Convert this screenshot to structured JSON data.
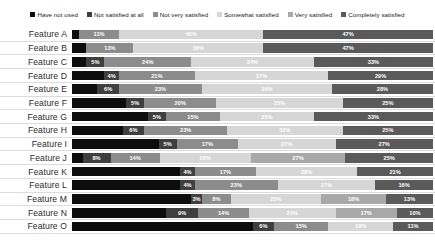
{
  "chart_data": {
    "type": "bar",
    "subtype": "stacked-horizontal-100pct",
    "title": "",
    "xlabel": "",
    "ylabel": "",
    "xlim": [
      0,
      100
    ],
    "grid": false,
    "legend_position": "top-center",
    "categories": [
      "Feature A",
      "Feature B",
      "Feature C",
      "Feature D",
      "Feature E",
      "Feature F",
      "Feature G",
      "Feature H",
      "Feature I",
      "Feature J",
      "Feature K",
      "Feature L",
      "Feature M",
      "Feature N",
      "Feature O"
    ],
    "series": [
      {
        "name": "Have not used",
        "color": "#0d0d0d",
        "values": [
          2,
          4,
          9,
          9,
          13,
          15,
          21,
          14,
          24,
          3,
          30,
          30,
          33,
          26,
          50
        ]
      },
      {
        "name": "Not satisfied at all",
        "color": "#3f3f3f",
        "values": [
          0,
          0,
          5,
          4,
          6,
          5,
          5,
          6,
          5,
          8,
          4,
          4,
          3,
          9,
          6
        ]
      },
      {
        "name": "Not very satisfied",
        "color": "#8c8c8c",
        "values": [
          11,
          13,
          24,
          21,
          23,
          20,
          15,
          23,
          17,
          14,
          17,
          23,
          8,
          14,
          15
        ]
      },
      {
        "name": "Somewhat satisfied",
        "color": "#d6d6d6",
        "values": [
          40,
          36,
          34,
          37,
          36,
          35,
          26,
          32,
          27,
          26,
          28,
          27,
          25,
          24,
          18
        ]
      },
      {
        "name": "Very satisfied",
        "color": "#a8a8a8",
        "values": [
          0,
          0,
          0,
          0,
          0,
          0,
          0,
          0,
          0,
          27,
          0,
          0,
          18,
          17,
          0
        ]
      },
      {
        "name": "Completely satisfied",
        "color": "#5a5a5a",
        "values": [
          47,
          47,
          33,
          29,
          28,
          25,
          33,
          25,
          27,
          25,
          21,
          16,
          13,
          10,
          11
        ]
      }
    ],
    "rows": [
      {
        "label": "Feature A",
        "segments": [
          {
            "series": "Have not used",
            "value": 2,
            "label": "",
            "color": "#0d0d0d",
            "text": "on-dark"
          },
          {
            "series": "Not very satisfied",
            "value": 11,
            "label": "11%",
            "color": "#8c8c8c",
            "text": "on-light"
          },
          {
            "series": "Somewhat satisfied",
            "value": 40,
            "label": "40%",
            "color": "#d6d6d6",
            "text": "on-pale"
          },
          {
            "series": "Completely satisfied",
            "value": 47,
            "label": "47%",
            "color": "#5a5a5a",
            "text": "on-dark"
          }
        ]
      },
      {
        "label": "Feature B",
        "segments": [
          {
            "series": "Have not used",
            "value": 4,
            "label": "",
            "color": "#0d0d0d",
            "text": "on-dark"
          },
          {
            "series": "Not very satisfied",
            "value": 13,
            "label": "13%",
            "color": "#8c8c8c",
            "text": "on-light"
          },
          {
            "series": "Somewhat satisfied",
            "value": 36,
            "label": "36%",
            "color": "#d6d6d6",
            "text": "on-pale"
          },
          {
            "series": "Completely satisfied",
            "value": 47,
            "label": "47%",
            "color": "#5a5a5a",
            "text": "on-dark"
          }
        ]
      },
      {
        "label": "Feature C",
        "segments": [
          {
            "series": "Have not used",
            "value": 4,
            "label": "",
            "color": "#0d0d0d",
            "text": "on-dark"
          },
          {
            "series": "Not satisfied at all",
            "value": 5,
            "label": "5%",
            "color": "#3f3f3f",
            "text": "on-dark"
          },
          {
            "series": "Not very satisfied",
            "value": 24,
            "label": "24%",
            "color": "#8c8c8c",
            "text": "on-light"
          },
          {
            "series": "Somewhat satisfied",
            "value": 34,
            "label": "34%",
            "color": "#d6d6d6",
            "text": "on-pale"
          },
          {
            "series": "Completely satisfied",
            "value": 33,
            "label": "33%",
            "color": "#5a5a5a",
            "text": "on-dark"
          }
        ]
      },
      {
        "label": "Feature D",
        "segments": [
          {
            "series": "Have not used",
            "value": 9,
            "label": "",
            "color": "#0d0d0d",
            "text": "on-dark"
          },
          {
            "series": "Not satisfied at all",
            "value": 4,
            "label": "4%",
            "color": "#3f3f3f",
            "text": "on-dark"
          },
          {
            "series": "Not very satisfied",
            "value": 21,
            "label": "21%",
            "color": "#8c8c8c",
            "text": "on-light"
          },
          {
            "series": "Somewhat satisfied",
            "value": 37,
            "label": "37%",
            "color": "#d6d6d6",
            "text": "on-pale"
          },
          {
            "series": "Completely satisfied",
            "value": 29,
            "label": "29%",
            "color": "#5a5a5a",
            "text": "on-dark"
          }
        ]
      },
      {
        "label": "Feature E",
        "segments": [
          {
            "series": "Have not used",
            "value": 7,
            "label": "",
            "color": "#0d0d0d",
            "text": "on-dark"
          },
          {
            "series": "Not satisfied at all",
            "value": 6,
            "label": "6%",
            "color": "#3f3f3f",
            "text": "on-dark"
          },
          {
            "series": "Not very satisfied",
            "value": 23,
            "label": "23%",
            "color": "#8c8c8c",
            "text": "on-light"
          },
          {
            "series": "Somewhat satisfied",
            "value": 36,
            "label": "36%",
            "color": "#d6d6d6",
            "text": "on-pale"
          },
          {
            "series": "Completely satisfied",
            "value": 28,
            "label": "28%",
            "color": "#5a5a5a",
            "text": "on-dark"
          }
        ]
      },
      {
        "label": "Feature F",
        "segments": [
          {
            "series": "Have not used",
            "value": 15,
            "label": "",
            "color": "#0d0d0d",
            "text": "on-dark"
          },
          {
            "series": "Not satisfied at all",
            "value": 5,
            "label": "5%",
            "color": "#3f3f3f",
            "text": "on-dark"
          },
          {
            "series": "Not very satisfied",
            "value": 20,
            "label": "20%",
            "color": "#8c8c8c",
            "text": "on-light"
          },
          {
            "series": "Somewhat satisfied",
            "value": 35,
            "label": "35%",
            "color": "#d6d6d6",
            "text": "on-pale"
          },
          {
            "series": "Completely satisfied",
            "value": 25,
            "label": "25%",
            "color": "#5a5a5a",
            "text": "on-dark"
          }
        ]
      },
      {
        "label": "Feature G",
        "segments": [
          {
            "series": "Have not used",
            "value": 21,
            "label": "",
            "color": "#0d0d0d",
            "text": "on-dark"
          },
          {
            "series": "Not satisfied at all",
            "value": 5,
            "label": "5%",
            "color": "#3f3f3f",
            "text": "on-dark"
          },
          {
            "series": "Not very satisfied",
            "value": 15,
            "label": "15%",
            "color": "#8c8c8c",
            "text": "on-light"
          },
          {
            "series": "Somewhat satisfied",
            "value": 26,
            "label": "26%",
            "color": "#d6d6d6",
            "text": "on-pale"
          },
          {
            "series": "Completely satisfied",
            "value": 33,
            "label": "33%",
            "color": "#5a5a5a",
            "text": "on-dark"
          }
        ]
      },
      {
        "label": "Feature H",
        "segments": [
          {
            "series": "Have not used",
            "value": 14,
            "label": "",
            "color": "#0d0d0d",
            "text": "on-dark"
          },
          {
            "series": "Not satisfied at all",
            "value": 6,
            "label": "6%",
            "color": "#3f3f3f",
            "text": "on-dark"
          },
          {
            "series": "Not very satisfied",
            "value": 23,
            "label": "23%",
            "color": "#8c8c8c",
            "text": "on-light"
          },
          {
            "series": "Somewhat satisfied",
            "value": 32,
            "label": "32%",
            "color": "#d6d6d6",
            "text": "on-pale"
          },
          {
            "series": "Completely satisfied",
            "value": 25,
            "label": "25%",
            "color": "#5a5a5a",
            "text": "on-dark"
          }
        ]
      },
      {
        "label": "Feature I",
        "segments": [
          {
            "series": "Have not used",
            "value": 24,
            "label": "",
            "color": "#0d0d0d",
            "text": "on-dark"
          },
          {
            "series": "Not satisfied at all",
            "value": 5,
            "label": "5%",
            "color": "#3f3f3f",
            "text": "on-dark"
          },
          {
            "series": "Not very satisfied",
            "value": 17,
            "label": "17%",
            "color": "#8c8c8c",
            "text": "on-light"
          },
          {
            "series": "Somewhat satisfied",
            "value": 27,
            "label": "27%",
            "color": "#d6d6d6",
            "text": "on-pale"
          },
          {
            "series": "Completely satisfied",
            "value": 27,
            "label": "27%",
            "color": "#5a5a5a",
            "text": "on-dark"
          }
        ]
      },
      {
        "label": "Feature J",
        "segments": [
          {
            "series": "Have not used",
            "value": 3,
            "label": "",
            "color": "#0d0d0d",
            "text": "on-dark"
          },
          {
            "series": "Not satisfied at all",
            "value": 8,
            "label": "8%",
            "color": "#3f3f3f",
            "text": "on-dark"
          },
          {
            "series": "Not very satisfied",
            "value": 14,
            "label": "14%",
            "color": "#8c8c8c",
            "text": "on-light"
          },
          {
            "series": "Somewhat satisfied",
            "value": 26,
            "label": "26%",
            "color": "#d6d6d6",
            "text": "on-pale"
          },
          {
            "series": "Very satisfied",
            "value": 27,
            "label": "27%",
            "color": "#a8a8a8",
            "text": "on-light"
          },
          {
            "series": "Completely satisfied",
            "value": 25,
            "label": "25%",
            "color": "#5a5a5a",
            "text": "on-dark"
          }
        ]
      },
      {
        "label": "Feature K",
        "segments": [
          {
            "series": "Have not used",
            "value": 30,
            "label": "",
            "color": "#0d0d0d",
            "text": "on-dark"
          },
          {
            "series": "Not satisfied at all",
            "value": 4,
            "label": "4%",
            "color": "#3f3f3f",
            "text": "on-dark"
          },
          {
            "series": "Not very satisfied",
            "value": 17,
            "label": "17%",
            "color": "#8c8c8c",
            "text": "on-light"
          },
          {
            "series": "Somewhat satisfied",
            "value": 28,
            "label": "28%",
            "color": "#d6d6d6",
            "text": "on-pale"
          },
          {
            "series": "Completely satisfied",
            "value": 21,
            "label": "21%",
            "color": "#5a5a5a",
            "text": "on-dark"
          }
        ]
      },
      {
        "label": "Feature L",
        "segments": [
          {
            "series": "Have not used",
            "value": 30,
            "label": "",
            "color": "#0d0d0d",
            "text": "on-dark"
          },
          {
            "series": "Not satisfied at all",
            "value": 4,
            "label": "4%",
            "color": "#3f3f3f",
            "text": "on-dark"
          },
          {
            "series": "Not very satisfied",
            "value": 23,
            "label": "23%",
            "color": "#8c8c8c",
            "text": "on-light"
          },
          {
            "series": "Somewhat satisfied",
            "value": 27,
            "label": "27%",
            "color": "#d6d6d6",
            "text": "on-pale"
          },
          {
            "series": "Completely satisfied",
            "value": 16,
            "label": "16%",
            "color": "#5a5a5a",
            "text": "on-dark"
          }
        ]
      },
      {
        "label": "Feature M",
        "segments": [
          {
            "series": "Have not used",
            "value": 33,
            "label": "",
            "color": "#0d0d0d",
            "text": "on-dark"
          },
          {
            "series": "Not satisfied at all",
            "value": 3,
            "label": "3%",
            "color": "#3f3f3f",
            "text": "on-dark"
          },
          {
            "series": "Not very satisfied",
            "value": 8,
            "label": "8%",
            "color": "#8c8c8c",
            "text": "on-light"
          },
          {
            "series": "Somewhat satisfied",
            "value": 25,
            "label": "25%",
            "color": "#d6d6d6",
            "text": "on-pale"
          },
          {
            "series": "Very satisfied",
            "value": 18,
            "label": "18%",
            "color": "#a8a8a8",
            "text": "on-light"
          },
          {
            "series": "Completely satisfied",
            "value": 13,
            "label": "13%",
            "color": "#5a5a5a",
            "text": "on-dark"
          }
        ]
      },
      {
        "label": "Feature N",
        "segments": [
          {
            "series": "Have not used",
            "value": 26,
            "label": "",
            "color": "#0d0d0d",
            "text": "on-dark"
          },
          {
            "series": "Not satisfied at all",
            "value": 9,
            "label": "9%",
            "color": "#3f3f3f",
            "text": "on-dark"
          },
          {
            "series": "Not very satisfied",
            "value": 14,
            "label": "14%",
            "color": "#8c8c8c",
            "text": "on-light"
          },
          {
            "series": "Somewhat satisfied",
            "value": 24,
            "label": "24%",
            "color": "#d6d6d6",
            "text": "on-pale"
          },
          {
            "series": "Very satisfied",
            "value": 17,
            "label": "17%",
            "color": "#a8a8a8",
            "text": "on-light"
          },
          {
            "series": "Completely satisfied",
            "value": 10,
            "label": "10%",
            "color": "#5a5a5a",
            "text": "on-dark"
          }
        ]
      },
      {
        "label": "Feature O",
        "segments": [
          {
            "series": "Have not used",
            "value": 50,
            "label": "",
            "color": "#0d0d0d",
            "text": "on-dark"
          },
          {
            "series": "Not satisfied at all",
            "value": 6,
            "label": "6%",
            "color": "#3f3f3f",
            "text": "on-dark"
          },
          {
            "series": "Not very satisfied",
            "value": 15,
            "label": "15%",
            "color": "#8c8c8c",
            "text": "on-light"
          },
          {
            "series": "Somewhat satisfied",
            "value": 18,
            "label": "18%",
            "color": "#d6d6d6",
            "text": "on-pale"
          },
          {
            "series": "Completely satisfied",
            "value": 11,
            "label": "11%",
            "color": "#5a5a5a",
            "text": "on-dark"
          }
        ]
      }
    ]
  },
  "legend": {
    "items": [
      {
        "label": "Have not used",
        "color": "#0d0d0d"
      },
      {
        "label": "Not satisfied at all",
        "color": "#3f3f3f"
      },
      {
        "label": "Not very satisfied",
        "color": "#8c8c8c"
      },
      {
        "label": "Somewhat satisfied",
        "color": "#d6d6d6"
      },
      {
        "label": "Very satisfied",
        "color": "#a8a8a8"
      },
      {
        "label": "Completely satisfied",
        "color": "#5a5a5a"
      }
    ]
  }
}
